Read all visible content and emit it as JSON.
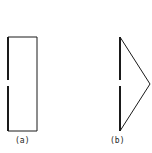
{
  "figures": [
    {
      "id": "a",
      "shape": "rectangle",
      "label": "(a)"
    },
    {
      "id": "b",
      "shape": "triangle",
      "label": "(b)"
    }
  ],
  "colors": {
    "stroke": "#1a1a1a",
    "background": "#ffffff"
  }
}
